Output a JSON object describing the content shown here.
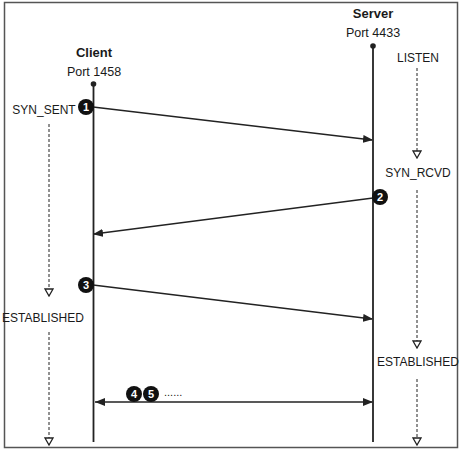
{
  "diagram": {
    "frame": {
      "stroke": "#555555"
    },
    "colors": {
      "line": "#222222",
      "badge_fill": "#111111",
      "badge_text": "#ffffff",
      "text": "#1a1a1a"
    },
    "client": {
      "name": "Client",
      "port_label": "Port 1458",
      "states": [
        "SYN_SENT",
        "ESTABLISHED"
      ]
    },
    "server": {
      "name": "Server",
      "port_label": "Port 4433",
      "states": [
        "LISTEN",
        "SYN_RCVD",
        "ESTABLISHED"
      ]
    },
    "messages": [
      {
        "step": "1",
        "direction": "client-to-server"
      },
      {
        "step": "2",
        "direction": "server-to-client"
      },
      {
        "step": "3",
        "direction": "client-to-server"
      },
      {
        "step": "4",
        "direction": "bidirectional"
      },
      {
        "step": "5",
        "direction": "bidirectional"
      }
    ],
    "continuation": "......"
  }
}
